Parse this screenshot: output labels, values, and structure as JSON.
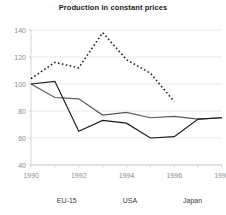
{
  "chart_data": {
    "type": "line",
    "title": "Production in constant prices",
    "xlabel": "",
    "ylabel": "",
    "x": [
      1990,
      1991,
      1992,
      1993,
      1994,
      1995,
      1996,
      1997,
      1998
    ],
    "xlim": [
      1990,
      1998
    ],
    "ylim": [
      40,
      140
    ],
    "yticks": [
      40,
      60,
      80,
      100,
      120,
      140
    ],
    "xticks": [
      1990,
      1992,
      1994,
      1996,
      1998
    ],
    "xtick_labels": [
      "1990",
      "1992",
      "1994",
      "1996",
      "1998"
    ],
    "ytick_labels": [
      "40",
      "60",
      "80",
      "100",
      "120",
      "140"
    ],
    "grid": "horizontal",
    "legend_position": "bottom",
    "series": [
      {
        "name": "EU-15",
        "style": "solid",
        "color": "#595959",
        "x": [
          1990,
          1991,
          1992,
          1993,
          1994,
          1995,
          1996,
          1997,
          1998
        ],
        "values": [
          100,
          90,
          89,
          77,
          79,
          75,
          76,
          74,
          75
        ]
      },
      {
        "name": "USA",
        "style": "solid",
        "color": "#1a1a1a",
        "x": [
          1990,
          1991,
          1992,
          1993,
          1994,
          1995,
          1996,
          1997,
          1998
        ],
        "values": [
          100,
          102,
          65,
          73,
          71,
          60,
          61,
          74,
          75
        ]
      },
      {
        "name": "Japan",
        "style": "dashed",
        "color": "#1a1a1a",
        "x": [
          1990,
          1991,
          1992,
          1993,
          1994,
          1995,
          1996
        ],
        "values": [
          104,
          116,
          112,
          138,
          118,
          108,
          87
        ]
      }
    ]
  },
  "legend": {
    "items": [
      {
        "label": "EU-15"
      },
      {
        "label": "USA"
      },
      {
        "label": "Japan"
      }
    ]
  }
}
